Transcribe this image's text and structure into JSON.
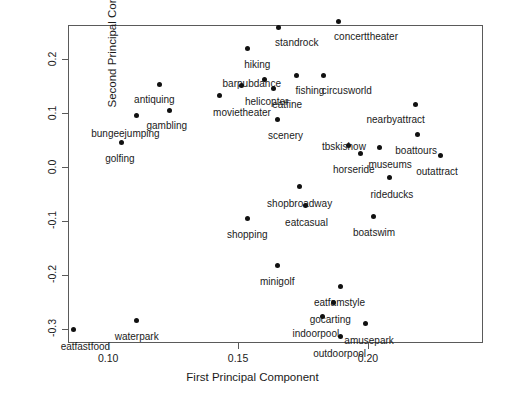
{
  "chart_data": {
    "type": "scatter",
    "title": "",
    "xlabel": "First Principal Component",
    "ylabel": "Second Principal Component",
    "xlim": [
      0.0848,
      0.2444
    ],
    "ylim": [
      -0.3255,
      0.264
    ],
    "grid": false,
    "legend": null,
    "xticks": [
      0.1,
      0.15,
      0.2
    ],
    "xticklabels": [
      "0.10",
      "0.15",
      "0.20"
    ],
    "yticks": [
      0.2,
      0.1,
      0.0,
      -0.1,
      -0.2,
      -0.3
    ],
    "yticklabels": [
      "0.2",
      "0.1",
      "0.0",
      "-0.1",
      "-0.2",
      "-0.3"
    ],
    "marker": "filled-circle",
    "marker_color": "#111111",
    "points": [
      {
        "label": "standrock",
        "x": 0.1654,
        "y": 0.2597,
        "lx": -3,
        "ly": 11
      },
      {
        "label": "concerttheater",
        "x": 0.1885,
        "y": 0.2705,
        "lx": -4,
        "ly": 11
      },
      {
        "label": "hiking",
        "x": 0.1535,
        "y": 0.22,
        "lx": -3,
        "ly": 11
      },
      {
        "label": "barpubdance",
        "x": 0.1602,
        "y": 0.163,
        "lx": -42,
        "ly": 0
      },
      {
        "label": "fishing",
        "x": 0.1725,
        "y": 0.1705,
        "lx": -1,
        "ly": 11
      },
      {
        "label": "circusworld",
        "x": 0.183,
        "y": 0.1705,
        "lx": -2,
        "ly": 11
      },
      {
        "label": "helicopter",
        "x": 0.1515,
        "y": 0.151,
        "lx": 3,
        "ly": 11
      },
      {
        "label": "eatfine",
        "x": 0.1635,
        "y": 0.1455,
        "lx": -1,
        "ly": 11
      },
      {
        "label": "movietheater",
        "x": 0.1427,
        "y": 0.134,
        "lx": -6,
        "ly": 13
      },
      {
        "label": "antiquing",
        "x": 0.1196,
        "y": 0.1545,
        "lx": -25,
        "ly": 11
      },
      {
        "label": "gambling",
        "x": 0.1236,
        "y": 0.106,
        "lx": -23,
        "ly": 11
      },
      {
        "label": "bungeejumping",
        "x": 0.1108,
        "y": 0.0955,
        "lx": -45,
        "ly": 13
      },
      {
        "label": "golfing",
        "x": 0.105,
        "y": 0.0462,
        "lx": -16,
        "ly": 12
      },
      {
        "label": "scenery",
        "x": 0.165,
        "y": 0.0895,
        "lx": -9,
        "ly": 12
      },
      {
        "label": "nearbyattract",
        "x": 0.2183,
        "y": 0.1165,
        "lx": -49,
        "ly": 11
      },
      {
        "label": "boattours",
        "x": 0.219,
        "y": 0.0601,
        "lx": -22,
        "ly": 11
      },
      {
        "label": "outattract",
        "x": 0.2278,
        "y": 0.0218,
        "lx": -24,
        "ly": 11
      },
      {
        "label": "tbskishow",
        "x": 0.1927,
        "y": 0.0397,
        "lx": -27,
        "ly": -4
      },
      {
        "label": "horseride",
        "x": 0.1973,
        "y": 0.026,
        "lx": -28,
        "ly": 12
      },
      {
        "label": "museums",
        "x": 0.2044,
        "y": 0.0358,
        "lx": -11,
        "ly": 12
      },
      {
        "label": "rideducks",
        "x": 0.2083,
        "y": -0.019,
        "lx": -19,
        "ly": 12
      },
      {
        "label": "shopbroadway",
        "x": 0.1735,
        "y": -0.0357,
        "lx": -32,
        "ly": 12
      },
      {
        "label": "eatcasual",
        "x": 0.1758,
        "y": -0.0715,
        "lx": -20,
        "ly": 12
      },
      {
        "label": "shopping",
        "x": 0.1538,
        "y": -0.0947,
        "lx": -21,
        "ly": 12
      },
      {
        "label": "boatswim",
        "x": 0.2023,
        "y": -0.0905,
        "lx": -21,
        "ly": 12
      },
      {
        "label": "minigolf",
        "x": 0.165,
        "y": -0.1815,
        "lx": -17,
        "ly": 12
      },
      {
        "label": "eatfamstyle",
        "x": 0.1896,
        "y": -0.2207,
        "lx": -27,
        "ly": 12
      },
      {
        "label": "gocarting",
        "x": 0.1868,
        "y": -0.251,
        "lx": -24,
        "ly": 12
      },
      {
        "label": "indoorpool",
        "x": 0.1825,
        "y": -0.2778,
        "lx": -30,
        "ly": 12
      },
      {
        "label": "amusepark",
        "x": 0.199,
        "y": -0.2905,
        "lx": -21,
        "ly": 12
      },
      {
        "label": "outdoorpool",
        "x": 0.1893,
        "y": -0.3148,
        "lx": -27,
        "ly": 12
      },
      {
        "label": "waterpark",
        "x": 0.111,
        "y": -0.2835,
        "lx": -22,
        "ly": 12
      },
      {
        "label": "eatfastfood",
        "x": 0.0867,
        "y": -0.3018,
        "lx": -13,
        "ly": 12
      }
    ]
  }
}
